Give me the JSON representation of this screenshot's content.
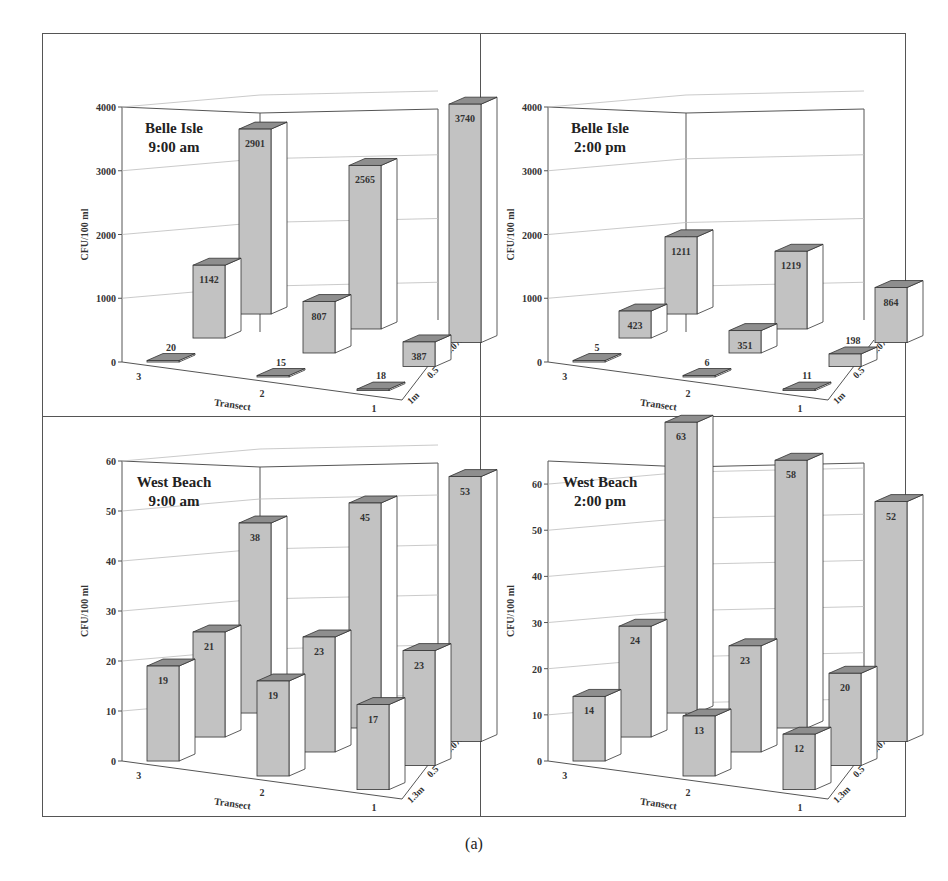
{
  "caption": "(a)",
  "colors": {
    "bar_front": "#c2c2c2",
    "bar_top": "#8e8e8e",
    "bar_side": "#ffffff",
    "stroke": "#333333",
    "grid": "#bdbdbd"
  },
  "chart_data": [
    {
      "type": "bar",
      "subtype": "3d-grouped-bar",
      "title": "Belle Isle\n9:00 am",
      "title_lines": [
        "Belle Isle",
        "9:00 am"
      ],
      "xlabel": "Transect",
      "ylabel": "CFU/100 ml",
      "ylim": [
        0,
        4000
      ],
      "yticks": [
        0,
        1000,
        2000,
        3000,
        4000
      ],
      "categories": [
        "3",
        "2",
        "1"
      ],
      "depth_labels": [
        "1m",
        "0.5",
        "0.075"
      ],
      "series": [
        {
          "name": "1m",
          "values": [
            20,
            15,
            18
          ]
        },
        {
          "name": "0.5",
          "values": [
            1142,
            807,
            387
          ]
        },
        {
          "name": "0.075",
          "values": [
            2901,
            2565,
            3740
          ]
        }
      ]
    },
    {
      "type": "bar",
      "subtype": "3d-grouped-bar",
      "title": "Belle Isle\n2:00 pm",
      "title_lines": [
        "Belle Isle",
        "2:00 pm"
      ],
      "xlabel": "Transect",
      "ylabel": "CFU/100 ml",
      "ylim": [
        0,
        4000
      ],
      "yticks": [
        0,
        1000,
        2000,
        3000,
        4000
      ],
      "categories": [
        "3",
        "2",
        "1"
      ],
      "depth_labels": [
        "1m",
        "0.5",
        "0.075"
      ],
      "series": [
        {
          "name": "1m",
          "values": [
            5,
            6,
            11
          ]
        },
        {
          "name": "0.5",
          "values": [
            423,
            351,
            198
          ]
        },
        {
          "name": "0.075",
          "values": [
            1211,
            1219,
            864
          ]
        }
      ]
    },
    {
      "type": "bar",
      "subtype": "3d-grouped-bar",
      "title": "West Beach\n9:00 am",
      "title_lines": [
        "West Beach",
        "9:00 am"
      ],
      "xlabel": "Transect",
      "ylabel": "CFU/100 ml",
      "ylim": [
        0,
        60
      ],
      "yticks": [
        0,
        10,
        20,
        30,
        40,
        50,
        60
      ],
      "categories": [
        "3",
        "2",
        "1"
      ],
      "depth_labels": [
        "1.3m",
        "0.5",
        "0.075"
      ],
      "series": [
        {
          "name": "1.3m",
          "values": [
            19,
            19,
            17
          ]
        },
        {
          "name": "0.5",
          "values": [
            21,
            23,
            23
          ]
        },
        {
          "name": "0.075",
          "values": [
            38,
            45,
            53
          ]
        }
      ]
    },
    {
      "type": "bar",
      "subtype": "3d-grouped-bar",
      "title": "West Beach\n2:00 pm",
      "title_lines": [
        "West Beach",
        "2:00 pm"
      ],
      "xlabel": "Transect",
      "ylabel": "CFU/100 ml",
      "ylim": [
        0,
        65
      ],
      "yticks": [
        0,
        10,
        20,
        30,
        40,
        50,
        60
      ],
      "categories": [
        "3",
        "2",
        "1"
      ],
      "depth_labels": [
        "1.3m",
        "0.5",
        "0.075"
      ],
      "series": [
        {
          "name": "1.3m",
          "values": [
            14,
            13,
            12
          ]
        },
        {
          "name": "0.5",
          "values": [
            24,
            23,
            20
          ]
        },
        {
          "name": "0.075",
          "values": [
            63,
            58,
            52
          ]
        }
      ]
    }
  ]
}
